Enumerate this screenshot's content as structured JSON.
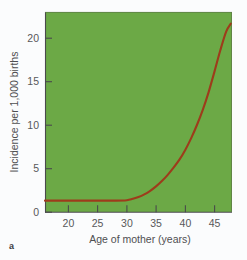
{
  "panel": {
    "letter": "a"
  },
  "colors": {
    "plot_background": "#6aa845",
    "curve": "#9d3c1b",
    "axis": "#4a4a4c",
    "tick_text": "#58585a",
    "page_background": "#fbfcfd"
  },
  "chart_data": {
    "type": "line",
    "title": "",
    "subtitle": "",
    "xlabel": "Age of mother (years)",
    "ylabel": "Incidence per 1,000 births",
    "xlim": [
      16,
      48
    ],
    "ylim": [
      0,
      22.5
    ],
    "xticks": [
      20,
      25,
      30,
      35,
      40,
      45
    ],
    "xtick_labels": [
      "20",
      "25",
      "30",
      "35",
      "40",
      "45"
    ],
    "yticks": [
      0,
      5,
      10,
      15,
      20
    ],
    "ytick_labels": [
      "0",
      "5",
      "10",
      "15",
      "20"
    ],
    "grid": false,
    "legend": "none",
    "series": [
      {
        "name": "Incidence",
        "color": "#9d3c1b",
        "x": [
          16,
          18,
          20,
          22,
          24,
          26,
          28,
          30,
          31,
          32,
          33,
          34,
          35,
          36,
          37,
          38,
          39,
          40,
          41,
          42,
          43,
          44,
          45,
          46,
          47,
          47.8
        ],
        "values": [
          1.3,
          1.3,
          1.3,
          1.3,
          1.3,
          1.3,
          1.3,
          1.35,
          1.5,
          1.7,
          2.0,
          2.4,
          2.9,
          3.5,
          4.2,
          5.0,
          5.9,
          7.0,
          8.3,
          9.8,
          11.5,
          13.5,
          15.8,
          18.2,
          20.3,
          21.2
        ]
      }
    ],
    "annotations": []
  }
}
